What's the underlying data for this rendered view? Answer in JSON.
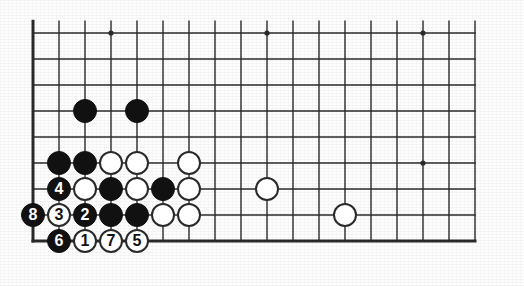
{
  "diagram": {
    "kind": "go-board-diagram",
    "colors": {
      "background": "#ffffff",
      "board": "#fdfdfd",
      "line": "#2a2a2a",
      "black_stone": "#111111",
      "white_stone": "#ffffff",
      "stone_outline": "#2a2a2a",
      "black_label": "#ffffff",
      "white_label": "#111111"
    },
    "grid": {
      "origin_x": 33,
      "origin_y": 33,
      "spacing": 26,
      "cols": 18,
      "rows": 9,
      "left_edge_heavy": true,
      "bottom_edge_heavy": true,
      "top_edge_heavy": false,
      "right_edge_heavy": false,
      "border_width": 3,
      "line_width": 1.4
    },
    "star_points": [
      {
        "col": 4,
        "row": 1
      },
      {
        "col": 10,
        "row": 1
      },
      {
        "col": 16,
        "row": 1
      },
      {
        "col": 16,
        "row": 6
      }
    ],
    "stone_radius": 12,
    "stones": [
      {
        "col": 3,
        "row": 4,
        "color": "black",
        "label": ""
      },
      {
        "col": 5,
        "row": 4,
        "color": "black",
        "label": ""
      },
      {
        "col": 2,
        "row": 6,
        "color": "black",
        "label": ""
      },
      {
        "col": 3,
        "row": 6,
        "color": "black",
        "label": ""
      },
      {
        "col": 4,
        "row": 6,
        "color": "white",
        "label": ""
      },
      {
        "col": 5,
        "row": 6,
        "color": "white",
        "label": ""
      },
      {
        "col": 7,
        "row": 6,
        "color": "white",
        "label": ""
      },
      {
        "col": 2,
        "row": 7,
        "color": "black",
        "label": "4"
      },
      {
        "col": 3,
        "row": 7,
        "color": "white",
        "label": ""
      },
      {
        "col": 4,
        "row": 7,
        "color": "black",
        "label": ""
      },
      {
        "col": 5,
        "row": 7,
        "color": "white",
        "label": ""
      },
      {
        "col": 6,
        "row": 7,
        "color": "black",
        "label": ""
      },
      {
        "col": 7,
        "row": 7,
        "color": "white",
        "label": ""
      },
      {
        "col": 10,
        "row": 7,
        "color": "white",
        "label": ""
      },
      {
        "col": 1,
        "row": 8,
        "color": "black",
        "label": "8"
      },
      {
        "col": 2,
        "row": 8,
        "color": "white",
        "label": "3"
      },
      {
        "col": 3,
        "row": 8,
        "color": "black",
        "label": "2"
      },
      {
        "col": 4,
        "row": 8,
        "color": "black",
        "label": ""
      },
      {
        "col": 5,
        "row": 8,
        "color": "black",
        "label": ""
      },
      {
        "col": 6,
        "row": 8,
        "color": "white",
        "label": ""
      },
      {
        "col": 7,
        "row": 8,
        "color": "white",
        "label": ""
      },
      {
        "col": 13,
        "row": 8,
        "color": "white",
        "label": ""
      },
      {
        "col": 2,
        "row": 9,
        "color": "black",
        "label": "6"
      },
      {
        "col": 3,
        "row": 9,
        "color": "white",
        "label": "1"
      },
      {
        "col": 4,
        "row": 9,
        "color": "white",
        "label": "7"
      },
      {
        "col": 5,
        "row": 9,
        "color": "white",
        "label": "5"
      }
    ],
    "move_sequence": [
      {
        "number": "1",
        "color": "white",
        "col": 3,
        "row": 9
      },
      {
        "number": "2",
        "color": "black",
        "col": 3,
        "row": 8
      },
      {
        "number": "3",
        "color": "white",
        "col": 2,
        "row": 8
      },
      {
        "number": "4",
        "color": "black",
        "col": 2,
        "row": 7
      },
      {
        "number": "5",
        "color": "white",
        "col": 5,
        "row": 9
      },
      {
        "number": "6",
        "color": "black",
        "col": 2,
        "row": 9
      },
      {
        "number": "7",
        "color": "white",
        "col": 4,
        "row": 9
      },
      {
        "number": "8",
        "color": "black",
        "col": 1,
        "row": 8
      }
    ]
  }
}
